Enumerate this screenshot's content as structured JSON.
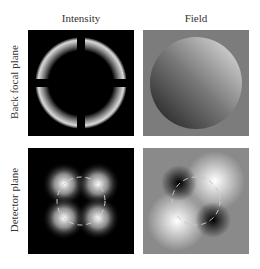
{
  "figure": {
    "columns": [
      {
        "label": "Intensity"
      },
      {
        "label": "Field"
      }
    ],
    "rows": [
      {
        "label": "Back focal plane"
      },
      {
        "label": "Detector plane"
      }
    ],
    "panels": [
      {
        "row": "Back focal plane",
        "column": "Intensity",
        "description": "Dark disk with bright crescent edges along the circular pupil boundary, four lobes of edge brightness"
      },
      {
        "row": "Back focal plane",
        "column": "Field",
        "description": "Gray background with a circular pupil showing a diagonal gradient from dark (lower-left) to bright (upper-right)"
      },
      {
        "row": "Detector plane",
        "column": "Intensity",
        "description": "Four bright lobes arranged in a 2x2 pattern on black background with dashed circle overlay"
      },
      {
        "row": "Detector plane",
        "column": "Field",
        "description": "Gray background with two bright lobes (upper-right, lower-left) and two dark lobes (upper-left, lower-right) with dashed circle overlay"
      }
    ],
    "colors": {
      "background": "#ffffff",
      "panel_dark": "#000000",
      "panel_gray": "#808080",
      "dashed_circle": "#d0d0d0"
    }
  }
}
